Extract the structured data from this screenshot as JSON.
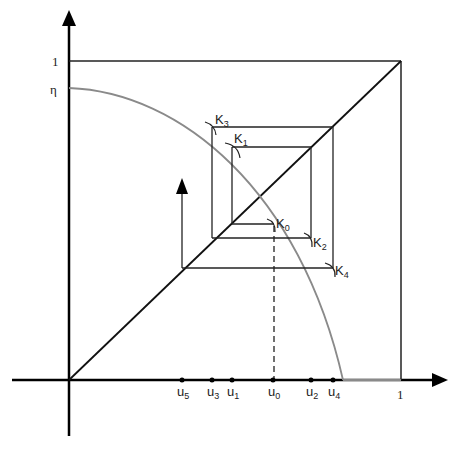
{
  "diagram": {
    "axes": {
      "y_tick_top": "1",
      "y_tick_eta": "η",
      "x_tick_one": "1"
    },
    "curve_label": "η",
    "points": [
      {
        "name": "K",
        "sub": "0"
      },
      {
        "name": "K",
        "sub": "1"
      },
      {
        "name": "K",
        "sub": "2"
      },
      {
        "name": "K",
        "sub": "3"
      },
      {
        "name": "K",
        "sub": "4"
      }
    ],
    "x_marks": [
      {
        "name": "u",
        "sub": "5"
      },
      {
        "name": "u",
        "sub": "3"
      },
      {
        "name": "u",
        "sub": "1"
      },
      {
        "name": "u",
        "sub": "0"
      },
      {
        "name": "u",
        "sub": "2"
      },
      {
        "name": "u",
        "sub": "4"
      }
    ],
    "colors": {
      "axis": "#000000",
      "lines": "#222222",
      "curve": "#8a8a8a"
    }
  }
}
